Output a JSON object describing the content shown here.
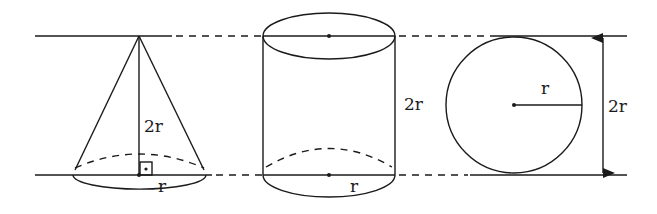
{
  "diagram": {
    "colors": {
      "stroke": "#1a1a1a",
      "background": "#ffffff"
    },
    "cone": {
      "height_label": "2r",
      "radius_label": "r",
      "right_angle_marker": true
    },
    "cylinder": {
      "height_label": "2r",
      "radius_label": "r"
    },
    "sphere": {
      "radius_label": "r",
      "diameter_label": "2r",
      "diameter_arrow": "double-arrow"
    }
  }
}
